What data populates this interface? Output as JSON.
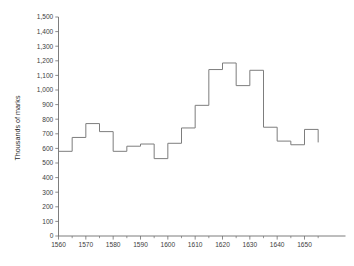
{
  "chart_data": {
    "type": "line",
    "step": "post",
    "title": "",
    "subtitle": "",
    "xlabel": "",
    "ylabel": "Thousands of marks",
    "xlim": [
      1560,
      1665
    ],
    "ylim": [
      0,
      1500
    ],
    "grid": false,
    "legend": "none",
    "y_ticks": [
      0,
      100,
      200,
      300,
      400,
      500,
      600,
      700,
      800,
      900,
      1000,
      1100,
      1200,
      1300,
      1400,
      1500
    ],
    "y_tick_labels": [
      "0",
      "100",
      "200",
      "300",
      "400",
      "500",
      "600",
      "700",
      "800",
      "900",
      "1,000",
      "1,100",
      "1,200",
      "1,300",
      "1,400",
      "1,500"
    ],
    "x_ticks_major": [
      1560,
      1570,
      1580,
      1590,
      1600,
      1610,
      1620,
      1630,
      1640,
      1650
    ],
    "x_tick_labels": [
      "1560",
      "1570",
      "1580",
      "1590",
      "1600",
      "1610",
      "1620",
      "1630",
      "1640",
      "1650"
    ],
    "x_ticks_minor": [
      1565,
      1575,
      1585,
      1595,
      1605,
      1615,
      1625,
      1635,
      1645,
      1655
    ],
    "bin_width_years": 5,
    "x": [
      1560,
      1565,
      1570,
      1575,
      1580,
      1585,
      1590,
      1595,
      1600,
      1605,
      1610,
      1615,
      1620,
      1625,
      1630,
      1635,
      1640,
      1645,
      1650
    ],
    "values": [
      580,
      675,
      770,
      715,
      580,
      615,
      630,
      530,
      635,
      740,
      895,
      1140,
      1185,
      1030,
      1135,
      745,
      650,
      625,
      730
    ],
    "series": [
      {
        "name": "Thousands of marks",
        "values": [
          580,
          675,
          770,
          715,
          580,
          615,
          630,
          530,
          635,
          740,
          895,
          1140,
          1185,
          1030,
          1135,
          745,
          650,
          625,
          730
        ]
      }
    ],
    "colors": {
      "line": "#7d7d7d",
      "axis": "#6e6e6e",
      "text": "#3d3d3d",
      "background": "#ffffff"
    }
  }
}
